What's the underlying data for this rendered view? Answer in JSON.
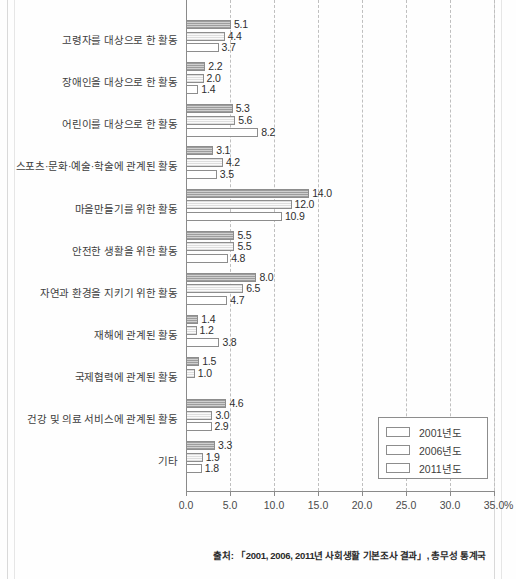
{
  "chart_data": {
    "type": "bar",
    "orientation": "horizontal",
    "title": "",
    "xlabel": "",
    "ylabel": "",
    "xlim": [
      0.0,
      35.0
    ],
    "unit": "%",
    "grid": true,
    "legend_position": "bottom-right",
    "xticks": [
      "0.0",
      "5.0",
      "10.0",
      "15.0",
      "20.0",
      "25.0",
      "30.0",
      "35.0"
    ],
    "xtick_values": [
      0.0,
      5.0,
      10.0,
      15.0,
      20.0,
      25.0,
      30.0,
      35.0
    ],
    "series": [
      {
        "name": "2001년도",
        "fill": "dark-hatch",
        "values": [
          26.5,
          5.1,
          2.2,
          5.3,
          3.1,
          14.0,
          5.5,
          8.0,
          1.4,
          1.5,
          4.6,
          3.3
        ]
      },
      {
        "name": "2006년도",
        "fill": "light-hatch",
        "values": [
          null,
          4.4,
          2.0,
          5.6,
          4.2,
          12.0,
          5.5,
          6.5,
          1.2,
          1.0,
          3.0,
          1.9
        ]
      },
      {
        "name": "2011년도",
        "fill": "white",
        "values": [
          null,
          3.7,
          1.4,
          8.2,
          3.5,
          10.9,
          4.8,
          4.7,
          3.8,
          null,
          2.9,
          1.8
        ]
      }
    ],
    "categories": [
      "",
      "고령자를 대상으로 한 활동",
      "장애인을 대상으로 한 활동",
      "어린이를 대상으로 한 활동",
      "스포츠·문화·예술·학술에 관계된 활동",
      "마을만들기를 위한 활동",
      "안전한 생활을 위한 활동",
      "자연과 환경을 지키기 위한 활동",
      "재해에 관계된 활동",
      "국제협력에 관계된 활동",
      "건강 및 의료 서비스에 관계된 활동",
      "기타"
    ]
  },
  "rows": [
    {
      "label": "",
      "clipped": true,
      "bars": [
        {
          "series": "2001년도",
          "value": 26.5,
          "text": "26.5"
        }
      ]
    },
    {
      "label": "고령자를 대상으로 한 활동",
      "bars": [
        {
          "series": "2001년도",
          "value": 5.1,
          "text": "5.1"
        },
        {
          "series": "2006년도",
          "value": 4.4,
          "text": "4.4"
        },
        {
          "series": "2011년도",
          "value": 3.7,
          "text": "3.7"
        }
      ]
    },
    {
      "label": "장애인을 대상으로 한 활동",
      "bars": [
        {
          "series": "2001년도",
          "value": 2.2,
          "text": "2.2"
        },
        {
          "series": "2006년도",
          "value": 2.0,
          "text": "2.0"
        },
        {
          "series": "2011년도",
          "value": 1.4,
          "text": "1.4"
        }
      ]
    },
    {
      "label": "어린이를 대상으로 한 활동",
      "bars": [
        {
          "series": "2001년도",
          "value": 5.3,
          "text": "5.3"
        },
        {
          "series": "2006년도",
          "value": 5.6,
          "text": "5.6"
        },
        {
          "series": "2011년도",
          "value": 8.2,
          "text": "8.2"
        }
      ]
    },
    {
      "label": "스포츠·문화·예술·학술에 관계된 활동",
      "bars": [
        {
          "series": "2001년도",
          "value": 3.1,
          "text": "3.1"
        },
        {
          "series": "2006년도",
          "value": 4.2,
          "text": "4.2"
        },
        {
          "series": "2011년도",
          "value": 3.5,
          "text": "3.5"
        }
      ]
    },
    {
      "label": "마을만들기를 위한 활동",
      "bars": [
        {
          "series": "2001년도",
          "value": 14.0,
          "text": "14.0"
        },
        {
          "series": "2006년도",
          "value": 12.0,
          "text": "12.0"
        },
        {
          "series": "2011년도",
          "value": 10.9,
          "text": "10.9"
        }
      ]
    },
    {
      "label": "안전한 생활을 위한 활동",
      "bars": [
        {
          "series": "2001년도",
          "value": 5.5,
          "text": "5.5"
        },
        {
          "series": "2006년도",
          "value": 5.5,
          "text": "5.5"
        },
        {
          "series": "2011년도",
          "value": 4.8,
          "text": "4.8"
        }
      ]
    },
    {
      "label": "자연과 환경을 지키기 위한 활동",
      "bars": [
        {
          "series": "2001년도",
          "value": 8.0,
          "text": "8.0"
        },
        {
          "series": "2006년도",
          "value": 6.5,
          "text": "6.5"
        },
        {
          "series": "2011년도",
          "value": 4.7,
          "text": "4.7"
        }
      ]
    },
    {
      "label": "재해에 관계된 활동",
      "bars": [
        {
          "series": "2001년도",
          "value": 1.4,
          "text": "1.4"
        },
        {
          "series": "2006년도",
          "value": 1.2,
          "text": "1.2"
        },
        {
          "series": "2011년도",
          "value": 3.8,
          "text": "3.8"
        }
      ]
    },
    {
      "label": "국제협력에 관계된 활동",
      "bars": [
        {
          "series": "2001년도",
          "value": 1.5,
          "text": "1.5"
        },
        {
          "series": "2006년도",
          "value": 1.0,
          "text": "1.0"
        }
      ]
    },
    {
      "label": "건강 및 의료 서비스에 관계된 활동",
      "bars": [
        {
          "series": "2001년도",
          "value": 4.6,
          "text": "4.6"
        },
        {
          "series": "2006년도",
          "value": 3.0,
          "text": "3.0"
        },
        {
          "series": "2011년도",
          "value": 2.9,
          "text": "2.9"
        }
      ]
    },
    {
      "label": "기타",
      "bars": [
        {
          "series": "2001년도",
          "value": 3.3,
          "text": "3.3"
        },
        {
          "series": "2006년도",
          "value": 1.9,
          "text": "1.9"
        },
        {
          "series": "2011년도",
          "value": 1.8,
          "text": "1.8"
        }
      ]
    }
  ],
  "legend": {
    "items": [
      {
        "label": "2001년도",
        "fill": "dark-hatch"
      },
      {
        "label": "2006년도",
        "fill": "light-hatch"
      },
      {
        "label": "2011년도",
        "fill": "white"
      }
    ]
  },
  "axis": {
    "unit_label": "%",
    "ticks": [
      "0.0",
      "5.0",
      "10.0",
      "15.0",
      "20.0",
      "25.0",
      "30.0",
      "35.0"
    ]
  },
  "source": {
    "text": "출처: 「2001, 2006, 2011년 사회생활 기본조사 결과」, 총무성 통계국"
  },
  "colors": {
    "axis": "#8a8a8a",
    "grid": "#bfbfbf",
    "bar_border": "#8d8d8d",
    "series_2001": "#bdbdbd",
    "series_2006": "#f2f2f2",
    "series_2011": "#ffffff",
    "text": "#3a3a3a"
  }
}
